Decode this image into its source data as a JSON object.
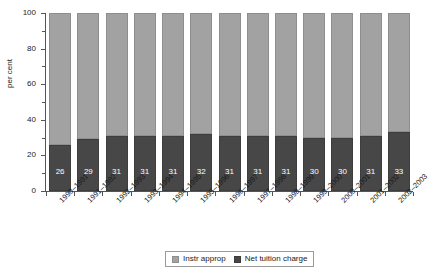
{
  "chart_data": {
    "type": "bar",
    "stacked": true,
    "stack_total": 100,
    "title": "",
    "xlabel": "",
    "ylabel": "per cent",
    "ylim": [
      0,
      100
    ],
    "yticks": [
      0,
      20,
      40,
      60,
      80,
      100
    ],
    "ytick_minor": [
      10,
      30,
      50,
      70,
      90
    ],
    "grid": false,
    "legend_position": "bottom-center",
    "categories": [
      "1990–1991",
      "1991–1992",
      "1992–1993",
      "1993–1994",
      "1994–1995",
      "1995–1996",
      "1996–1997",
      "1997–1998",
      "1998–1999",
      "1999–2000",
      "2000–2001",
      "2001–2002",
      "2002–2003"
    ],
    "series": [
      {
        "name": "Instr approp",
        "color": "#a2a2a2",
        "values": [
          74,
          71,
          69,
          69,
          69,
          68,
          69,
          69,
          69,
          70,
          70,
          69,
          67
        ]
      },
      {
        "name": "Net tuition charge",
        "color": "#474747",
        "values": [
          26,
          29,
          31,
          31,
          31,
          32,
          31,
          31,
          31,
          30,
          30,
          31,
          33
        ],
        "data_labels": [
          "26",
          "29",
          "31",
          "31",
          "31",
          "32",
          "31",
          "31",
          "31",
          "30",
          "30",
          "31",
          "33"
        ],
        "data_label_color": "#ffffff"
      }
    ]
  },
  "legend": {
    "items": [
      {
        "label": "Instr approp",
        "swatch": "light"
      },
      {
        "label": "Net tuition charge",
        "swatch": "dark"
      }
    ]
  }
}
